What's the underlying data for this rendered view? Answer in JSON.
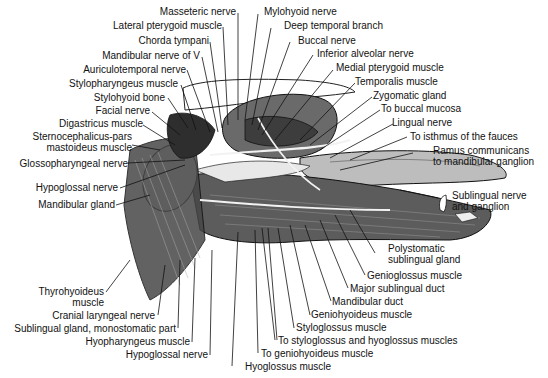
{
  "figure": {
    "colors": {
      "ink": "#111111",
      "background": "#ffffff",
      "muscle_shade": "#555555",
      "gland_fill": "#e8e8e8"
    }
  },
  "labels_top": [
    {
      "id": "masseteric-nerve",
      "text": "Masseteric nerve"
    },
    {
      "id": "mylohyoid-nerve",
      "text": "Mylohyoid nerve"
    },
    {
      "id": "lateral-pterygoid-muscle",
      "text": "Lateral pterygoid muscle"
    },
    {
      "id": "deep-temporal-branch",
      "text": "Deep temporal branch"
    },
    {
      "id": "chorda-tympani",
      "text": "Chorda tympani"
    },
    {
      "id": "buccal-nerve",
      "text": "Buccal nerve"
    },
    {
      "id": "mandibular-nerve-of-v",
      "text": "Mandibular nerve of V"
    },
    {
      "id": "inferior-alveolar-nerve",
      "text": "Inferior alveolar nerve"
    },
    {
      "id": "auriculotemporal-nerve",
      "text": "Auriculotemporal nerve"
    },
    {
      "id": "medial-pterygoid-muscle",
      "text": "Medial pterygoid muscle"
    },
    {
      "id": "stylopharyngeus-muscle",
      "text": "Stylopharyngeus muscle"
    },
    {
      "id": "temporalis-muscle",
      "text": "Temporalis muscle"
    },
    {
      "id": "stylohyoid-bone",
      "text": "Stylohyoid bone"
    },
    {
      "id": "zygomatic-gland",
      "text": "Zygomatic gland"
    },
    {
      "id": "facial-nerve",
      "text": "Facial nerve"
    },
    {
      "id": "to-buccal-mucosa",
      "text": "To buccal mucosa"
    },
    {
      "id": "digastricus-muscle",
      "text": "Digastricus muscle"
    },
    {
      "id": "lingual-nerve",
      "text": "Lingual nerve"
    }
  ],
  "labels_left": [
    {
      "id": "sternocephalicus",
      "text": "Sternocephalicus-pars",
      "text2": "mastoideus muscle"
    },
    {
      "id": "glossopharyngeal-nerve",
      "text": "Glossopharyngeal nerve"
    },
    {
      "id": "hypoglossal-nerve-left",
      "text": "Hypoglossal nerve"
    },
    {
      "id": "mandibular-gland",
      "text": "Mandibular gland"
    },
    {
      "id": "thyrohyoideus-muscle",
      "text": "Thyrohyoideus",
      "text2": "muscle"
    },
    {
      "id": "cranial-laryngeal-nerve",
      "text": "Cranial laryngeal nerve"
    },
    {
      "id": "sublingual-gland-monostomatic",
      "text": "Sublingual gland, monostomatic part"
    },
    {
      "id": "hyopharyngeus-muscle",
      "text": "Hyopharyngeus muscle"
    },
    {
      "id": "hypoglossal-nerve-bottom",
      "text": "Hypoglossal nerve"
    }
  ],
  "labels_right": [
    {
      "id": "to-isthmus-of-fauces",
      "text": "To isthmus of the fauces"
    },
    {
      "id": "ramus-communicans",
      "text": "Ramus communicans",
      "text2": "to mandibular ganglion"
    },
    {
      "id": "sublingual-nerve-ganglion",
      "text": "Sublingual nerve",
      "text2": "and ganglion"
    },
    {
      "id": "polystomatic-sublingual-gland",
      "text": "Polystomatic",
      "text2": "sublingual gland"
    },
    {
      "id": "genioglossus-muscle",
      "text": "Genioglossus muscle"
    },
    {
      "id": "major-sublingual-duct",
      "text": "Major sublingual duct"
    },
    {
      "id": "mandibular-duct",
      "text": "Mandibular duct"
    },
    {
      "id": "geniohyoideus-muscle",
      "text": "Geniohyoideus muscle"
    },
    {
      "id": "styloglossus-muscle",
      "text": "Styloglossus muscle"
    },
    {
      "id": "to-styloglossus-hyoglossus",
      "text": "To styloglossus and hyoglossus muscles"
    },
    {
      "id": "to-geniohyoideus-muscle",
      "text": "To geniohyoideus muscle"
    },
    {
      "id": "hyoglossus-muscle",
      "text": "Hyoglossus muscle"
    }
  ]
}
